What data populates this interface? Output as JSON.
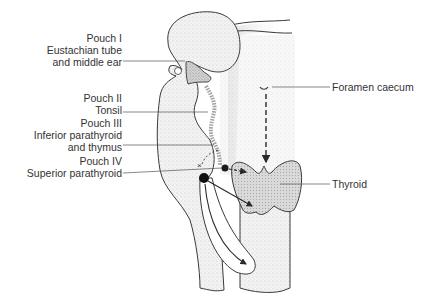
{
  "diagram": {
    "colors": {
      "outline": "#3a3a3a",
      "stipple_light": "#e6e6e6",
      "stipple_mid": "#cfcfcf",
      "stipple_dark": "#b5b5b5",
      "text": "#333333",
      "background": "#ffffff"
    },
    "labels": {
      "pouch1": {
        "title": "Pouch I",
        "line2": "Eustachian tube",
        "line3": "and middle ear"
      },
      "pouch2": {
        "title": "Pouch II",
        "line2": "Tonsil"
      },
      "pouch3": {
        "title": "Pouch III",
        "line2": "Inferior parathyroid",
        "line3": "and thymus"
      },
      "pouch4": {
        "title": "Pouch IV",
        "line2": "Superior parathyroid"
      },
      "foramen": {
        "title": "Foramen caecum"
      },
      "thyroid": {
        "title": "Thyroid"
      }
    },
    "annotations": [
      "dashed arrow from foramen caecum down to thyroid",
      "dashed arrow from pouch IV dot to thyroid",
      "solid arrow from pouch III dot to thyroid",
      "curved arrow from pouch III dot down to thymus",
      "dashed curved line from pouch III to x mark"
    ]
  }
}
